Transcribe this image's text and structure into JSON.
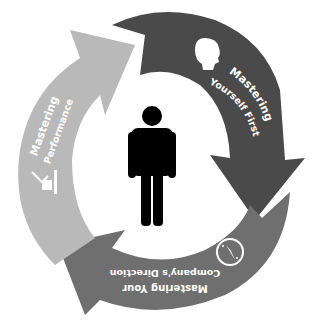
{
  "diagram": {
    "type": "cycle",
    "center": {
      "icon": "person-icon",
      "label": ""
    },
    "segments": [
      {
        "id": "yourself",
        "line1": "Mastering",
        "line2": "Yourself First",
        "icon": "head-silhouette-icon",
        "color": "#4a4a4a"
      },
      {
        "id": "direction",
        "line1": "Mastering Your",
        "line2": "Company's Direction",
        "icon": "compass-icon",
        "color": "#6f6f6f"
      },
      {
        "id": "performance",
        "line1": "Mastering",
        "line2": "Performance",
        "icon": "performance-chart-icon",
        "color": "#b9b9b9"
      }
    ]
  }
}
